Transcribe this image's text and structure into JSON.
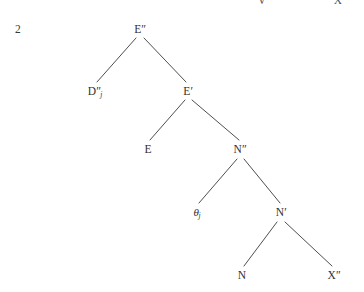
{
  "figure": {
    "type": "syntactic-tree-diagram",
    "example_number": "2",
    "background_color": "#ffffff",
    "line_color": "#3a3a3a",
    "text_color": "#33302f",
    "width": 364,
    "height": 292
  },
  "clipped_top_row": [
    {
      "id": "clipped-v",
      "text": "V",
      "x": 262
    },
    {
      "id": "clipped-x",
      "text": "X",
      "x": 338
    }
  ],
  "nodes": [
    {
      "id": "root-e2",
      "base": "E",
      "prime": "″",
      "sub": "",
      "x": 140,
      "y": 30,
      "label": "E″"
    },
    {
      "id": "d2-j",
      "base": "D",
      "prime": "″",
      "sub": "j",
      "x": 95,
      "y": 92,
      "label": "D″j"
    },
    {
      "id": "e1",
      "base": "E",
      "prime": "′",
      "sub": "",
      "x": 188,
      "y": 92,
      "label": "E′"
    },
    {
      "id": "e0",
      "base": "E",
      "prime": "",
      "sub": "",
      "x": 148,
      "y": 150,
      "label": "E"
    },
    {
      "id": "n2",
      "base": "N",
      "prime": "″",
      "sub": "",
      "x": 240,
      "y": 150,
      "label": "N″"
    },
    {
      "id": "theta-j",
      "base": "θ",
      "prime": "",
      "sub": "j",
      "x": 197,
      "y": 213,
      "label": "θj"
    },
    {
      "id": "n1",
      "base": "N",
      "prime": "′",
      "sub": "",
      "x": 281,
      "y": 213,
      "label": "N′"
    },
    {
      "id": "n0",
      "base": "N",
      "prime": "",
      "sub": "",
      "x": 242,
      "y": 276,
      "label": "N"
    },
    {
      "id": "x2",
      "base": "X",
      "prime": "″",
      "sub": "",
      "x": 334,
      "y": 276,
      "label": "X″"
    }
  ],
  "edges": [
    {
      "id": "edge-root-to-d2",
      "from": "root-e2",
      "to": "d2-j",
      "x1": 136,
      "y1": 38,
      "x2": 97,
      "y2": 82
    },
    {
      "id": "edge-root-to-e1",
      "from": "root-e2",
      "to": "e1",
      "x1": 144,
      "y1": 38,
      "x2": 186,
      "y2": 82
    },
    {
      "id": "edge-e1-to-e0",
      "from": "e1",
      "to": "e0",
      "x1": 185,
      "y1": 100,
      "x2": 150,
      "y2": 140
    },
    {
      "id": "edge-e1-to-n2",
      "from": "e1",
      "to": "n2",
      "x1": 192,
      "y1": 100,
      "x2": 239,
      "y2": 140
    },
    {
      "id": "edge-n2-to-theta",
      "from": "n2",
      "to": "theta-j",
      "x1": 237,
      "y1": 159,
      "x2": 199,
      "y2": 203
    },
    {
      "id": "edge-n2-to-n1",
      "from": "n2",
      "to": "n1",
      "x1": 244,
      "y1": 159,
      "x2": 280,
      "y2": 203
    },
    {
      "id": "edge-n1-to-n0",
      "from": "n1",
      "to": "n0",
      "x1": 277,
      "y1": 222,
      "x2": 244,
      "y2": 266
    },
    {
      "id": "edge-n1-to-x2",
      "from": "n1",
      "to": "x2",
      "x1": 285,
      "y1": 222,
      "x2": 332,
      "y2": 266
    }
  ]
}
